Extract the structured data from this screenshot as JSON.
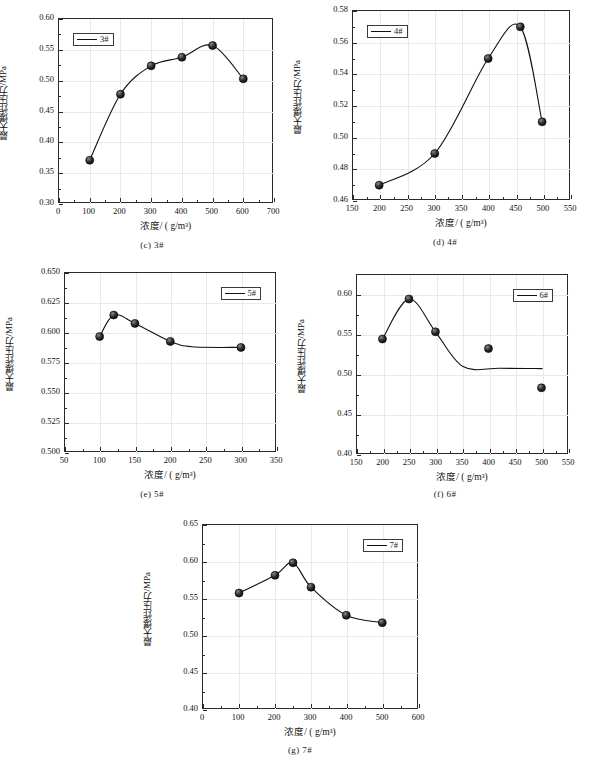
{
  "figure": {
    "axis_labels": {
      "x": "浓度/ ( g/m³)",
      "y": "最大爆炸压力/MPa"
    }
  },
  "chart_data": [
    {
      "id": "c",
      "type": "scatter",
      "caption": "(c) 3#",
      "legend": "3#",
      "legend_position": "top-left",
      "title": "",
      "xlabel": "浓度/ ( g/m³)",
      "ylabel": "最大爆炸压力/MPa",
      "xlim": [
        0,
        700
      ],
      "ylim": [
        0.3,
        0.6
      ],
      "xticks": [
        0,
        100,
        200,
        300,
        400,
        500,
        600,
        700
      ],
      "yticks": [
        "0.30",
        "0.35",
        "0.40",
        "0.45",
        "0.50",
        "0.55",
        "0.60"
      ],
      "grid": true,
      "x": [
        100,
        200,
        300,
        400,
        500,
        600
      ],
      "values": [
        0.371,
        0.478,
        0.524,
        0.538,
        0.557,
        0.503
      ]
    },
    {
      "id": "d",
      "type": "scatter",
      "caption": "(d) 4#",
      "legend": "4#",
      "legend_position": "top-left",
      "title": "",
      "xlabel": "浓度/ ( g/m³)",
      "ylabel": "最大爆炸压力/MPa",
      "xlim": [
        150,
        550
      ],
      "ylim": [
        0.46,
        0.58
      ],
      "xticks": [
        150,
        200,
        250,
        300,
        350,
        400,
        450,
        500,
        550
      ],
      "yticks": [
        "0.46",
        "0.48",
        "0.50",
        "0.52",
        "0.54",
        "0.56",
        "0.58"
      ],
      "grid": true,
      "x": [
        198,
        300,
        398,
        457,
        497
      ],
      "values": [
        0.47,
        0.49,
        0.55,
        0.57,
        0.51
      ]
    },
    {
      "id": "e",
      "type": "scatter",
      "caption": "(e) 5#",
      "legend": "5#",
      "legend_position": "top-right",
      "title": "",
      "xlabel": "浓度/ ( g/m³)",
      "ylabel": "最大爆炸压力/MPa",
      "xlim": [
        50,
        350
      ],
      "ylim": [
        0.5,
        0.65
      ],
      "xticks": [
        50,
        100,
        150,
        200,
        250,
        300,
        350
      ],
      "yticks": [
        "0.500",
        "0.525",
        "0.550",
        "0.575",
        "0.600",
        "0.625",
        "0.650"
      ],
      "grid": true,
      "x": [
        99,
        119,
        149,
        199,
        299
      ],
      "values": [
        0.597,
        0.615,
        0.608,
        0.593,
        0.588
      ]
    },
    {
      "id": "f",
      "type": "scatter",
      "caption": "(f) 6#",
      "legend": "6#",
      "legend_position": "top-right",
      "title": "",
      "xlabel": "浓度/ ( g/m³)",
      "ylabel": "最大爆炸压力/MPa",
      "xlim": [
        150,
        550
      ],
      "ylim": [
        0.4,
        0.625
      ],
      "xticks": [
        150,
        200,
        250,
        300,
        350,
        400,
        450,
        500,
        550
      ],
      "yticks": [
        "0.40",
        "0.45",
        "0.50",
        "0.55",
        "0.60"
      ],
      "grid": true,
      "x": [
        198,
        248,
        298,
        398,
        498
      ],
      "values": [
        0.545,
        0.595,
        0.554,
        0.533,
        0.484
      ]
    },
    {
      "id": "g",
      "type": "scatter",
      "caption": "(g) 7#",
      "legend": "7#",
      "legend_position": "top-right",
      "title": "",
      "xlabel": "浓度/ ( g/m³)",
      "ylabel": "最大爆炸压力/MPa",
      "xlim": [
        0,
        600
      ],
      "ylim": [
        0.4,
        0.65
      ],
      "xticks": [
        0,
        100,
        200,
        300,
        400,
        500,
        600
      ],
      "yticks": [
        "0.40",
        "0.45",
        "0.50",
        "0.55",
        "0.60",
        "0.65"
      ],
      "grid": true,
      "x": [
        100,
        200,
        250,
        300,
        398,
        498
      ],
      "values": [
        0.558,
        0.582,
        0.599,
        0.566,
        0.528,
        0.518
      ]
    }
  ]
}
